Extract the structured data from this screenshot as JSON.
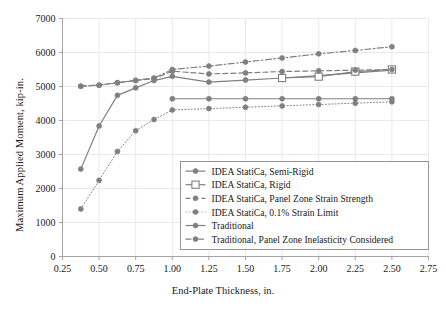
{
  "chart_data": {
    "type": "line",
    "title": "",
    "xlabel": "End-Plate Thickness, in.",
    "ylabel": "Maximum Applied Moment, kip-in.",
    "xlim": [
      0.25,
      2.75
    ],
    "ylim": [
      0,
      7000
    ],
    "xticks": [
      "0.25",
      "0.50",
      "0.75",
      "1.00",
      "1.25",
      "1.50",
      "1.75",
      "2.00",
      "2.25",
      "2.50",
      "2.75"
    ],
    "yticks": [
      "0",
      "1000",
      "2000",
      "3000",
      "4000",
      "5000",
      "6000",
      "7000"
    ],
    "grid": true,
    "legend_position": "lower-right-inside",
    "line_color": "#808080",
    "series": [
      {
        "name": "IDEA StatiCa, Semi-Rigid",
        "style": "solid",
        "marker": "filled-circle",
        "x": [
          0.375,
          0.5,
          0.625,
          0.75,
          0.875,
          1.0,
          1.25,
          1.5,
          1.75,
          2.0,
          2.25,
          2.5
        ],
        "values": [
          2570,
          3840,
          4740,
          4960,
          5175,
          5300,
          5130,
          5190,
          5250,
          5320,
          5400,
          5480
        ]
      },
      {
        "name": "IDEA StatiCa, Rigid",
        "style": "solid",
        "marker": "open-square",
        "x": [
          1.75,
          2.0,
          2.25,
          2.5
        ],
        "values": [
          5250,
          5290,
          5440,
          5500
        ]
      },
      {
        "name": "IDEA StatiCa, Panel Zone Strain Strength",
        "style": "dashed",
        "marker": "filled-circle",
        "x": [
          0.375,
          0.5,
          0.625,
          0.75,
          0.875,
          1.0,
          1.25,
          1.5,
          1.75,
          2.0,
          2.25,
          2.5
        ],
        "values": [
          5010,
          5040,
          5110,
          5180,
          5230,
          5450,
          5370,
          5400,
          5440,
          5460,
          5480,
          5500
        ]
      },
      {
        "name": "IDEA StatiCa, 0.1% Strain Limit",
        "style": "dotted",
        "marker": "filled-circle",
        "x": [
          0.375,
          0.5,
          0.625,
          0.75,
          0.875,
          1.0,
          1.25,
          1.5,
          1.75,
          2.0,
          2.25,
          2.5
        ],
        "values": [
          1400,
          2240,
          3090,
          3700,
          4030,
          4310,
          4350,
          4390,
          4430,
          4470,
          4510,
          4550
        ]
      },
      {
        "name": "Traditional",
        "style": "solid",
        "marker": "filled-circle",
        "x": [
          1.0,
          1.25,
          1.5,
          1.75,
          2.0,
          2.25,
          2.5
        ],
        "values": [
          4640,
          4640,
          4640,
          4640,
          4640,
          4640,
          4640
        ]
      },
      {
        "name": "Traditional, Panel Zone Inelasticity Considered",
        "style": "dashdot",
        "marker": "filled-circle",
        "x": [
          0.375,
          0.5,
          0.625,
          0.75,
          0.875,
          1.0,
          1.25,
          1.5,
          1.75,
          2.0,
          2.25,
          2.5
        ],
        "values": [
          5010,
          5040,
          5110,
          5180,
          5250,
          5500,
          5600,
          5720,
          5840,
          5960,
          6060,
          6170
        ]
      }
    ]
  }
}
